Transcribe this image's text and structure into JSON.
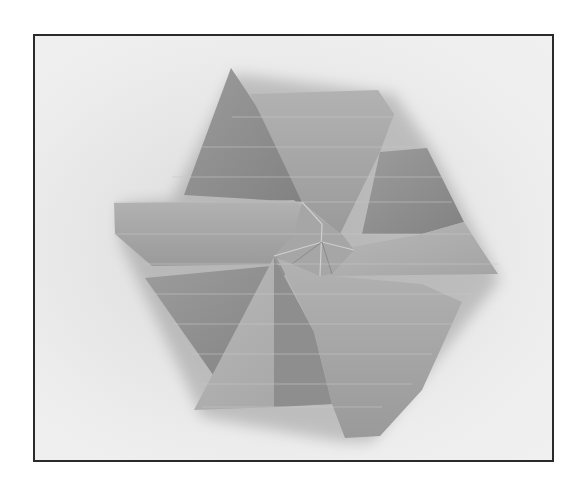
{
  "image": {
    "subject": "origami hexagonal twist tessellation",
    "description": "Grayscale photo of a folded paper six-pointed twist fold with pleated flaps spiraling around a central twist, on a light gray background inside a thin black border",
    "colors": {
      "border": "#2a2a2a",
      "background": "#e8e8e8",
      "paper_light": "#b4b4b4",
      "paper_mid": "#a2a2a2",
      "paper_dark": "#8c8c8c",
      "shadow": "#7a7a7a",
      "crease": "#cfcfcf"
    }
  }
}
